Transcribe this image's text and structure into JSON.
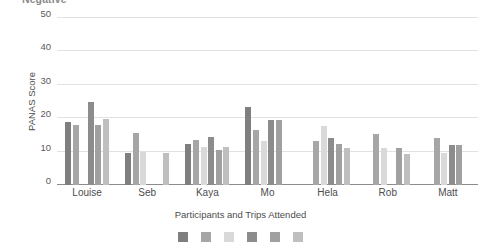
{
  "chart_data": {
    "type": "bar",
    "title": "Negative",
    "xlabel": "Participants and Trips Attended",
    "ylabel": "PANAS Score",
    "ylim": [
      0,
      50
    ],
    "yticks": [
      0,
      10,
      20,
      30,
      40,
      50
    ],
    "grid": true,
    "legend_position": "bottom",
    "categories": [
      "Louise",
      "Seb",
      "Kaya",
      "Mo",
      "Hela",
      "Rob",
      "Matt"
    ],
    "series": [
      {
        "name": "Trip 1",
        "color": "#7f7f7f",
        "values": [
          19.0,
          9.6,
          12.4,
          23.5,
          null,
          null,
          null
        ]
      },
      {
        "name": "Trip 2",
        "color": "#a6a6a6",
        "values": [
          17.9,
          15.6,
          13.5,
          16.5,
          13.3,
          15.3,
          14.2
        ]
      },
      {
        "name": "Trip 3",
        "color": "#d9d9d9",
        "values": [
          null,
          10.0,
          11.5,
          13.3,
          17.7,
          11.2,
          9.5
        ]
      },
      {
        "name": "Trip 4",
        "color": "#8c8c8c",
        "values": [
          24.8,
          null,
          14.4,
          19.5,
          14.2,
          null,
          12.1
        ]
      },
      {
        "name": "Trip 5",
        "color": "#a0a0a0",
        "values": [
          18.0,
          null,
          10.4,
          19.6,
          12.2,
          11.2,
          12.1
        ]
      },
      {
        "name": "Trip 6",
        "color": "#bfbfbf",
        "values": [
          19.8,
          9.5,
          11.4,
          null,
          11.1,
          9.4,
          null
        ]
      }
    ]
  },
  "axis": {
    "y_tick_labels": [
      "0",
      "10",
      "20",
      "30",
      "40",
      "50"
    ]
  }
}
